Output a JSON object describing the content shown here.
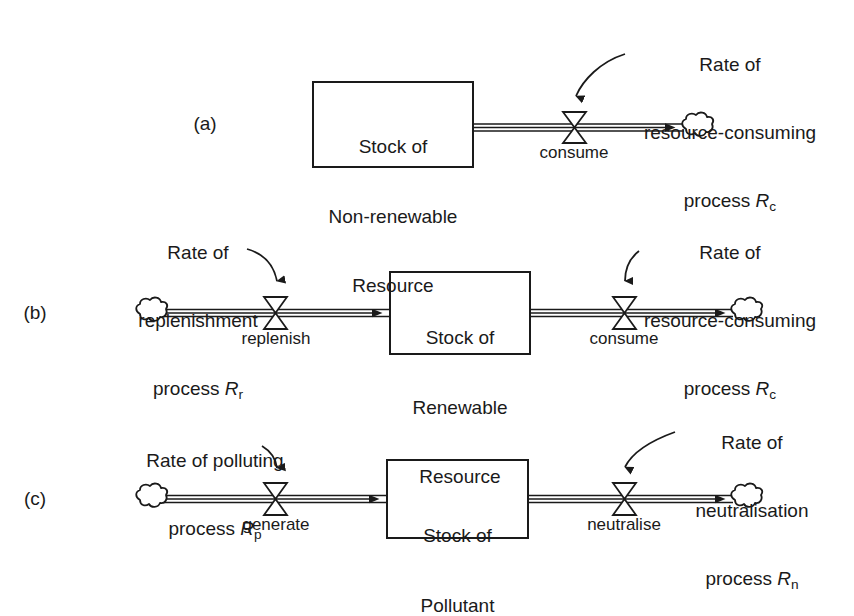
{
  "figure": {
    "type": "stock-and-flow-diagram",
    "stroke_color": "#1a1a1a",
    "background_color": "#ffffff"
  },
  "panels": [
    {
      "letter": "(a)",
      "stock": {
        "lines": [
          "Stock of",
          "Non-renewable",
          "Resource"
        ]
      },
      "flows": [
        {
          "name": "consume",
          "label": "consume",
          "rate_label": {
            "lines": [
              "Rate of",
              "resource-consuming",
              "process "
            ],
            "symbol": "R",
            "subscript": "c"
          }
        }
      ],
      "sources": [],
      "sinks": [
        "cloud"
      ]
    },
    {
      "letter": "(b)",
      "stock": {
        "lines": [
          "Stock of",
          "Renewable",
          "Resource"
        ]
      },
      "flows": [
        {
          "name": "replenish",
          "label": "replenish",
          "rate_label": {
            "lines": [
              "Rate of",
              "replenishment",
              "process "
            ],
            "symbol": "R",
            "subscript": "r"
          }
        },
        {
          "name": "consume",
          "label": "consume",
          "rate_label": {
            "lines": [
              "Rate of",
              "resource-consuming",
              "process "
            ],
            "symbol": "R",
            "subscript": "c"
          }
        }
      ],
      "sources": [
        "cloud"
      ],
      "sinks": [
        "cloud"
      ]
    },
    {
      "letter": "(c)",
      "stock": {
        "lines": [
          "Stock of",
          "Pollutant"
        ]
      },
      "flows": [
        {
          "name": "generate",
          "label": "generate",
          "rate_label": {
            "lines": [
              "Rate of polluting",
              "process "
            ],
            "symbol": "R",
            "subscript": "p"
          }
        },
        {
          "name": "neutralise",
          "label": "neutralise",
          "rate_label": {
            "lines": [
              "Rate of",
              "neutralisation",
              "process "
            ],
            "symbol": "R",
            "subscript": "n"
          }
        }
      ],
      "sources": [
        "cloud"
      ],
      "sinks": [
        "cloud"
      ]
    }
  ],
  "text": {
    "a_letter": "(a)",
    "a_stock_l1": "Stock of",
    "a_stock_l2": "Non-renewable",
    "a_stock_l3": "Resource",
    "a_flow_consume": "consume",
    "a_rate_l1": "Rate of",
    "a_rate_l2": "resource-consuming",
    "a_rate_l3": "process ",
    "a_rate_sym": "R",
    "a_rate_sub": "c",
    "b_letter": "(b)",
    "b_stock_l1": "Stock of",
    "b_stock_l2": "Renewable",
    "b_stock_l3": "Resource",
    "b_flow_replenish": "replenish",
    "b_flow_consume": "consume",
    "b_rate_left_l1": "Rate of",
    "b_rate_left_l2": "replenishment",
    "b_rate_left_l3": "process ",
    "b_rate_left_sym": "R",
    "b_rate_left_sub": "r",
    "b_rate_right_l1": "Rate of",
    "b_rate_right_l2": "resource-consuming",
    "b_rate_right_l3": "process ",
    "b_rate_right_sym": "R",
    "b_rate_right_sub": "c",
    "c_letter": "(c)",
    "c_stock_l1": "Stock of",
    "c_stock_l2": "Pollutant",
    "c_flow_generate": "generate",
    "c_flow_neutralise": "neutralise",
    "c_rate_left_l1": "Rate of polluting",
    "c_rate_left_l2": "process ",
    "c_rate_left_sym": "R",
    "c_rate_left_sub": "p",
    "c_rate_right_l1": "Rate of",
    "c_rate_right_l2": "neutralisation",
    "c_rate_right_l3": "process ",
    "c_rate_right_sym": "R",
    "c_rate_right_sub": "n"
  }
}
